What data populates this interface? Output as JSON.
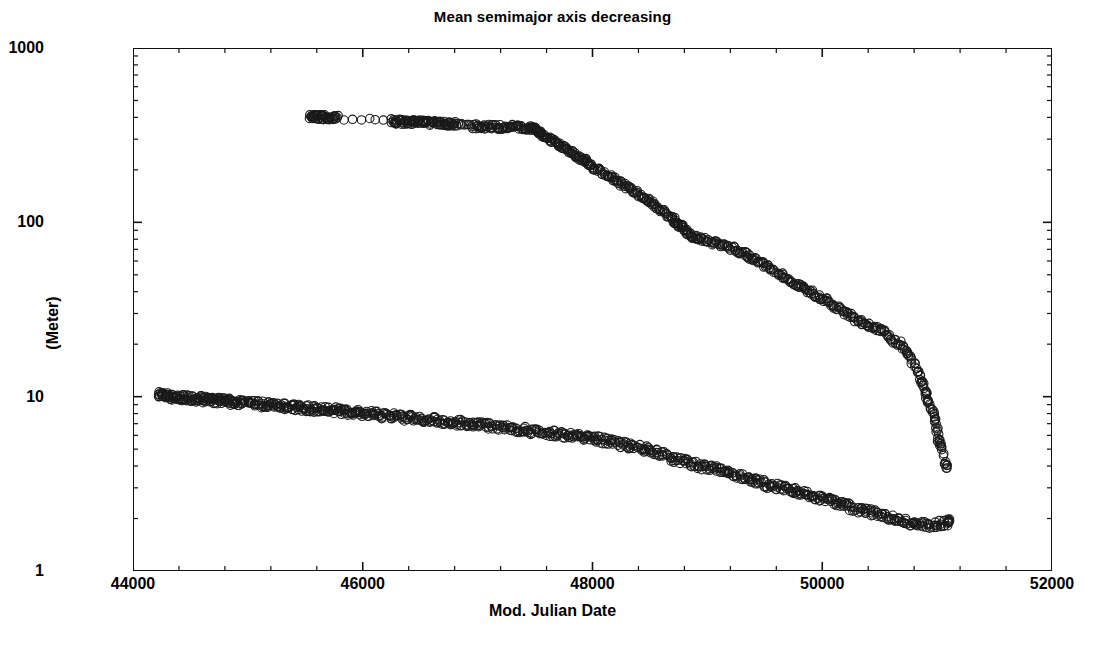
{
  "chart_data": {
    "type": "scatter",
    "title": "Mean semimajor axis decreasing",
    "xlabel": "Mod. Julian Date",
    "ylabel": "(Meter)",
    "xlim": [
      44000,
      52000
    ],
    "ylim": [
      1,
      1000
    ],
    "yscale": "log",
    "xscale": "linear",
    "grid": false,
    "legend": "none",
    "xticks": [
      44000,
      46000,
      48000,
      50000,
      52000
    ],
    "xtick_labels": [
      "44000",
      "46000",
      "48000",
      "50000",
      "52000"
    ],
    "yticks": [
      1,
      10,
      100,
      1000
    ],
    "ytick_labels": [
      "1",
      "10",
      "100",
      "1000"
    ],
    "marker": "open-circle",
    "marker_size": 5,
    "series": [
      {
        "name": "upper-branch",
        "x": [
          45540,
          45570,
          45600,
          45630,
          45660,
          45700,
          45740,
          45780,
          46250,
          46290,
          46330,
          46370,
          46410,
          46450,
          46490,
          46530,
          46570,
          46610,
          46650,
          46690,
          46730,
          46770,
          46810,
          46950,
          47000,
          47050,
          47100,
          47150,
          47200,
          47250,
          47300,
          47350,
          47400,
          47440,
          47470,
          47500,
          47530,
          47560,
          47600,
          47640,
          47680,
          47720,
          47760,
          47800,
          47840,
          47880,
          47920,
          47960,
          48000,
          48050,
          48100,
          48150,
          48200,
          48250,
          48300,
          48350,
          48400,
          48450,
          48500,
          48550,
          48600,
          48650,
          48700,
          48730,
          48760,
          48790,
          48820,
          48860,
          48900,
          48950,
          49000,
          49060,
          49120,
          49180,
          49240,
          49300,
          49360,
          49420,
          49480,
          49540,
          49600,
          49660,
          49720,
          49780,
          49840,
          49900,
          49960,
          50020,
          50080,
          50140,
          50200,
          50260,
          50320,
          50380,
          50440,
          50500,
          50560,
          50620,
          50680,
          50730,
          50780,
          50830,
          50870,
          50900,
          50930,
          50960,
          50990,
          51010,
          51040,
          51080
        ],
        "y": [
          405,
          404,
          403,
          402,
          401,
          400,
          400,
          399,
          380,
          379,
          378,
          377,
          376,
          375,
          374,
          373,
          372,
          371,
          370,
          369,
          368,
          367,
          366,
          356,
          355,
          354,
          354,
          353,
          353,
          352,
          352,
          351,
          350,
          348,
          344,
          338,
          330,
          320,
          308,
          296,
          286,
          276,
          266,
          256,
          246,
          237,
          228,
          219,
          210,
          200,
          191,
          183,
          175,
          167,
          160,
          152,
          145,
          138,
          131,
          124,
          117,
          110,
          104,
          100,
          96,
          92,
          88,
          84,
          82,
          80,
          78,
          76,
          74,
          72,
          70,
          67,
          64,
          61,
          58,
          55,
          52,
          49,
          46,
          44,
          42,
          40,
          38,
          36,
          34,
          32,
          30,
          29,
          27,
          26,
          25,
          24,
          23,
          21,
          20,
          18,
          16,
          14,
          12,
          10.5,
          9.2,
          8.0,
          6.8,
          5.6,
          5.3,
          4.0
        ]
      },
      {
        "name": "lower-branch",
        "x": [
          44220,
          44250,
          44280,
          44310,
          44340,
          44380,
          44420,
          44460,
          44500,
          44540,
          44580,
          44620,
          44660,
          44700,
          44740,
          44780,
          44820,
          44860,
          44900,
          44950,
          45000,
          45050,
          45100,
          45150,
          45200,
          45250,
          45300,
          45350,
          45400,
          45450,
          45500,
          45550,
          45600,
          45650,
          45700,
          45750,
          45800,
          45850,
          45900,
          45950,
          46000,
          46060,
          46120,
          46180,
          46240,
          46300,
          46360,
          46420,
          46480,
          46540,
          46600,
          46660,
          46720,
          46780,
          46840,
          46900,
          46960,
          47020,
          47080,
          47140,
          47200,
          47260,
          47320,
          47380,
          47440,
          47500,
          47560,
          47620,
          47680,
          47740,
          47800,
          47860,
          47920,
          47980,
          48040,
          48100,
          48160,
          48220,
          48280,
          48340,
          48400,
          48460,
          48520,
          48580,
          48640,
          48700,
          48760,
          48820,
          48880,
          48940,
          49000,
          49060,
          49120,
          49180,
          49240,
          49300,
          49360,
          49420,
          49480,
          49540,
          49600,
          49660,
          49720,
          49780,
          49840,
          49900,
          49960,
          50020,
          50080,
          50140,
          50200,
          50260,
          50320,
          50380,
          50440,
          50500,
          50560,
          50620,
          50680,
          50740,
          50800,
          50860,
          50920,
          50980,
          51040,
          51100
        ],
        "y": [
          10.4,
          10.3,
          10.2,
          10.1,
          10.0,
          9.95,
          9.9,
          9.85,
          9.8,
          9.75,
          9.7,
          9.65,
          9.6,
          9.55,
          9.5,
          9.45,
          9.4,
          9.35,
          9.3,
          9.25,
          9.2,
          9.15,
          9.1,
          9.0,
          8.95,
          8.9,
          8.85,
          8.8,
          8.75,
          8.7,
          8.6,
          8.55,
          8.5,
          8.45,
          8.4,
          8.35,
          8.3,
          8.2,
          8.15,
          8.1,
          8.0,
          7.95,
          7.9,
          7.8,
          7.75,
          7.7,
          7.6,
          7.55,
          7.5,
          7.4,
          7.35,
          7.3,
          7.2,
          7.15,
          7.1,
          7.0,
          6.95,
          6.9,
          6.8,
          6.75,
          6.7,
          6.6,
          6.55,
          6.5,
          6.4,
          6.3,
          6.25,
          6.2,
          6.1,
          6.05,
          6.0,
          5.9,
          5.85,
          5.8,
          5.7,
          5.6,
          5.5,
          5.4,
          5.3,
          5.2,
          5.1,
          5.0,
          4.9,
          4.8,
          4.6,
          4.4,
          4.3,
          4.2,
          4.1,
          4.0,
          3.9,
          3.85,
          3.8,
          3.7,
          3.6,
          3.5,
          3.4,
          3.3,
          3.2,
          3.1,
          3.05,
          3.0,
          2.9,
          2.85,
          2.8,
          2.7,
          2.65,
          2.6,
          2.5,
          2.45,
          2.4,
          2.3,
          2.25,
          2.2,
          2.15,
          2.1,
          2.05,
          2.0,
          1.95,
          1.9,
          1.88,
          1.85,
          1.83,
          1.85,
          1.87,
          1.9
        ]
      }
    ]
  }
}
